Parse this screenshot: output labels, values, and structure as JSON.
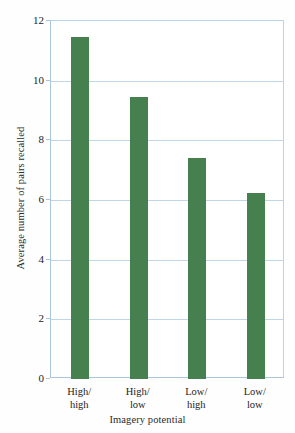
{
  "chart_data": {
    "type": "bar",
    "title": "",
    "subtitle": "",
    "categories": [
      "High/\nhigh",
      "High/\nlow",
      "Low/\nhigh",
      "Low/\nlow"
    ],
    "category_lines": [
      [
        "High/",
        "high"
      ],
      [
        "High/",
        "low"
      ],
      [
        "Low/",
        "high"
      ],
      [
        "Low/",
        "low"
      ]
    ],
    "values": [
      11.45,
      9.45,
      7.4,
      6.25
    ],
    "xlabel": "Imagery potential",
    "ylabel": "Average number of pairs recalled",
    "ylim": [
      0,
      12
    ],
    "yticks": [
      0,
      2,
      4,
      6,
      8,
      10,
      12
    ],
    "ytick_labels": [
      "0",
      "2",
      "4",
      "6",
      "8",
      "10",
      "12"
    ],
    "grid": true,
    "grid_axis": "y",
    "legend": false,
    "legend_position": "none",
    "bar_color": "#46804f",
    "grid_color": "#bfd6ea",
    "axis_color": "#a9c6de",
    "background": "#ffffff"
  }
}
